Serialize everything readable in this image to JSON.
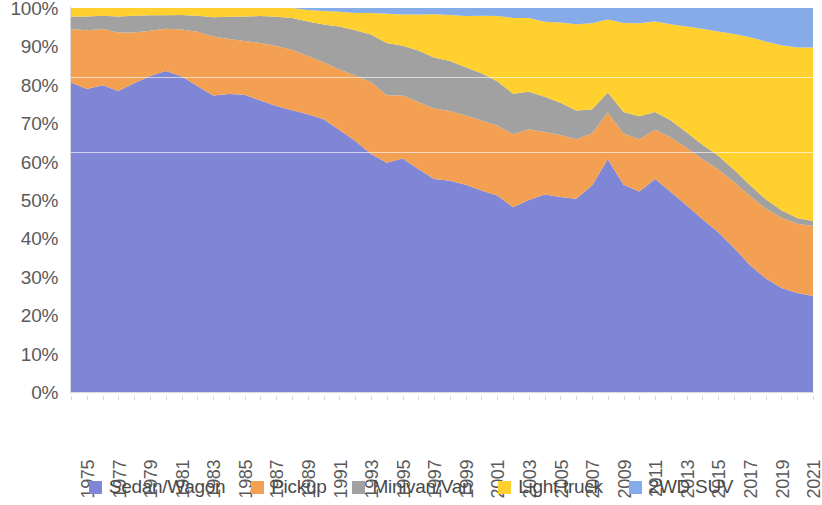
{
  "chart_data": {
    "type": "area",
    "stacked": true,
    "normalized": true,
    "title": "",
    "subtitle": "",
    "xlabel": "",
    "ylabel": "",
    "ylim": [
      0,
      100
    ],
    "y_tick_labels": [
      "0%",
      "10%",
      "20%",
      "30%",
      "40%",
      "50%",
      "60%",
      "70%",
      "80%",
      "90%",
      "100%"
    ],
    "y_tick_values": [
      0,
      10,
      20,
      30,
      40,
      50,
      60,
      70,
      80,
      90,
      100
    ],
    "grid": false,
    "legend_position": "bottom",
    "x": [
      1975,
      1976,
      1977,
      1978,
      1979,
      1980,
      1981,
      1982,
      1983,
      1984,
      1985,
      1986,
      1987,
      1988,
      1989,
      1990,
      1991,
      1992,
      1993,
      1994,
      1995,
      1996,
      1997,
      1998,
      1999,
      2000,
      2001,
      2002,
      2003,
      2004,
      2005,
      2006,
      2007,
      2008,
      2009,
      2010,
      2011,
      2012,
      2013,
      2014,
      2015,
      2016,
      2017,
      2018,
      2019,
      2020,
      2021,
      2022
    ],
    "x_tick_labels": [
      "1975",
      "1977",
      "1979",
      "1981",
      "1983",
      "1985",
      "1987",
      "1989",
      "1991",
      "1993",
      "1995",
      "1997",
      "1999",
      "2001",
      "2003",
      "2005",
      "2007",
      "2009",
      "2011",
      "2013",
      "2015",
      "2017",
      "2019",
      "2021"
    ],
    "series": [
      {
        "name": "Sedan/Wagon",
        "color": "#8086D6",
        "values": [
          80.6,
          78.9,
          79.9,
          78.4,
          80.4,
          82.3,
          83.6,
          82.2,
          79.7,
          77.2,
          77.6,
          77.4,
          75.9,
          74.5,
          73.4,
          72.3,
          71.0,
          68.2,
          65.4,
          62.0,
          59.7,
          60.8,
          58.1,
          55.5,
          55.0,
          54.0,
          52.5,
          51.2,
          48.1,
          50.0,
          51.4,
          50.8,
          50.3,
          53.8,
          60.6,
          54.0,
          52.2,
          55.5,
          52.1,
          48.6,
          45.0,
          41.6,
          37.5,
          33.1,
          29.6,
          27.1,
          25.8,
          25.0
        ]
      },
      {
        "name": "Pickup",
        "color": "#F4A052",
        "values": [
          13.9,
          15.3,
          14.6,
          15.2,
          13.2,
          11.8,
          11.0,
          12.2,
          14.1,
          15.4,
          14.3,
          14.0,
          15.0,
          15.6,
          15.7,
          15.2,
          14.9,
          15.8,
          17.0,
          18.7,
          17.6,
          16.4,
          17.4,
          18.3,
          18.2,
          18.0,
          18.2,
          18.2,
          19.0,
          18.4,
          16.3,
          16.1,
          15.5,
          13.5,
          12.2,
          13.3,
          13.6,
          12.8,
          14.2,
          15.0,
          15.6,
          16.4,
          17.2,
          18.0,
          18.2,
          18.3,
          18.0,
          18.2
        ]
      },
      {
        "name": "Minivan/Van",
        "color": "#A1A1A1",
        "values": [
          3.3,
          3.6,
          3.5,
          4.2,
          4.4,
          4.0,
          3.5,
          3.8,
          4.2,
          5.0,
          5.8,
          6.4,
          7.0,
          7.6,
          8.3,
          9.0,
          9.8,
          11.2,
          11.8,
          12.4,
          13.6,
          13.0,
          13.4,
          13.3,
          13.0,
          12.6,
          12.3,
          11.5,
          10.6,
          9.8,
          9.2,
          8.4,
          7.5,
          6.3,
          5.2,
          5.6,
          6.0,
          4.6,
          4.4,
          4.0,
          3.8,
          3.5,
          3.2,
          2.8,
          2.4,
          1.9,
          1.5,
          1.3
        ]
      },
      {
        "name": "Light truck",
        "color": "#FFD02E",
        "values": [
          2.2,
          2.2,
          2.0,
          2.2,
          2.0,
          1.9,
          1.9,
          1.8,
          2.0,
          2.4,
          2.3,
          2.2,
          2.1,
          2.3,
          2.6,
          3.0,
          3.5,
          3.8,
          4.5,
          5.6,
          7.6,
          8.1,
          9.4,
          11.3,
          12.0,
          13.3,
          15.0,
          17.0,
          19.7,
          19.2,
          19.5,
          20.9,
          22.5,
          22.4,
          19.0,
          23.2,
          24.2,
          23.6,
          25.1,
          27.6,
          30.2,
          32.4,
          35.3,
          38.5,
          41.1,
          43.0,
          44.4,
          45.2
        ]
      },
      {
        "name": "2WD SUV",
        "color": "#85ABE8",
        "values": [
          0.0,
          0.0,
          0.0,
          0.0,
          0.0,
          0.0,
          0.0,
          0.0,
          0.0,
          0.0,
          0.0,
          0.0,
          0.0,
          0.0,
          0.0,
          0.5,
          0.8,
          1.0,
          1.3,
          1.3,
          1.5,
          1.7,
          1.7,
          1.6,
          1.8,
          2.1,
          2.0,
          2.1,
          2.6,
          2.6,
          3.6,
          3.8,
          4.2,
          4.0,
          3.0,
          3.9,
          4.0,
          3.5,
          4.2,
          4.8,
          5.4,
          6.1,
          6.8,
          7.6,
          8.7,
          9.7,
          10.3,
          10.3
        ]
      }
    ],
    "legend": [
      {
        "label": "Sedan/Wagon",
        "color": "#8086D6"
      },
      {
        "label": "Pickup",
        "color": "#F4A052"
      },
      {
        "label": "Minivan/Van",
        "color": "#A1A1A1"
      },
      {
        "label": "Light truck",
        "color": "#FFD02E"
      },
      {
        "label": "2WD SUV",
        "color": "#85ABE8"
      }
    ]
  }
}
